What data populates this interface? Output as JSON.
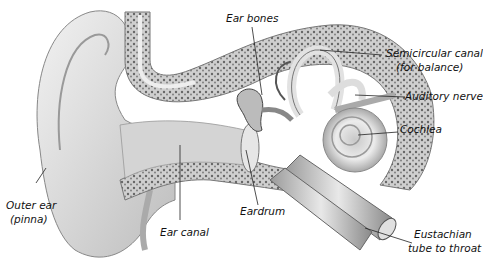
{
  "diagram": {
    "type": "anatomy-illustration",
    "labels": {
      "ear_bones": "Ear bones",
      "semicircular_canal_1": "Semicircular canal",
      "semicircular_canal_2": "(for balance)",
      "auditory_nerve": "Auditory nerve",
      "cochlea": "Cochlea",
      "outer_ear_1": "Outer ear",
      "outer_ear_2": "(pinna)",
      "ear_canal": "Ear canal",
      "eardrum": "Eardrum",
      "eustachian_1": "Eustachian",
      "eustachian_2": "tube to throat"
    }
  }
}
